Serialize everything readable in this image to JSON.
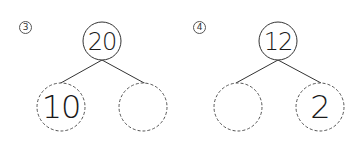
{
  "worksheet": {
    "type": "number-bond",
    "problems": [
      {
        "number": "3",
        "whole": "20",
        "parts": [
          "10",
          ""
        ],
        "colors": {
          "line": "#333333",
          "dashed": "#555555"
        }
      },
      {
        "number": "4",
        "whole": "12",
        "parts": [
          "",
          "2"
        ],
        "colors": {
          "line": "#333333",
          "dashed": "#555555"
        }
      }
    ]
  }
}
